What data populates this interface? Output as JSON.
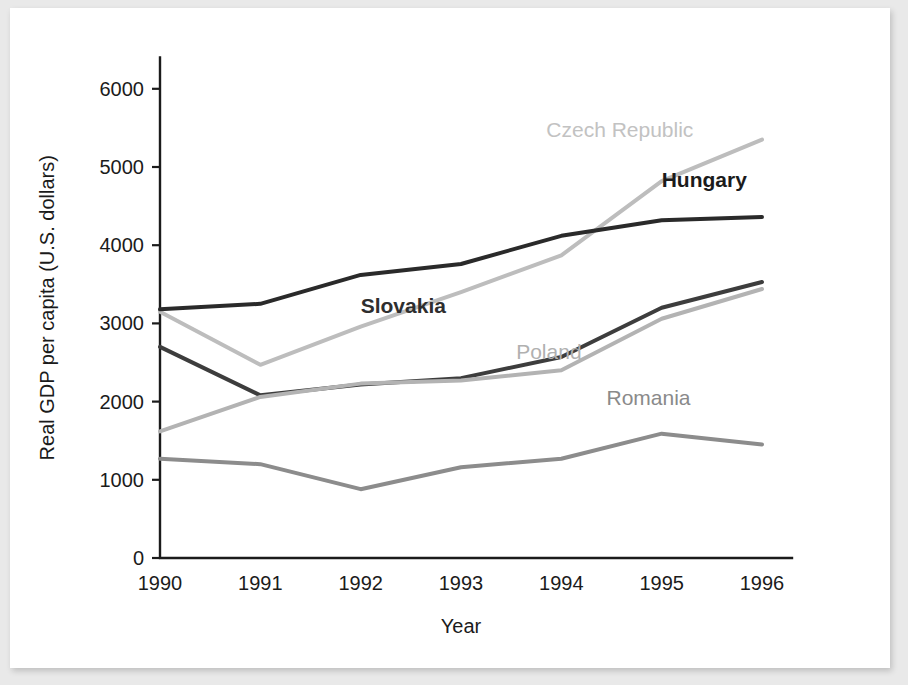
{
  "chart_data": {
    "type": "line",
    "title": "",
    "xlabel": "Year",
    "ylabel": "Real GDP per capita (U.S. dollars)",
    "x": [
      1990,
      1991,
      1992,
      1993,
      1994,
      1995,
      1996
    ],
    "xtick_labels": [
      "1990",
      "1991",
      "1992",
      "1993",
      "1994",
      "1995",
      "1996"
    ],
    "ytick_labels": [
      "0",
      "1000",
      "2000",
      "3000",
      "4000",
      "5000",
      "6000"
    ],
    "yticks": [
      0,
      1000,
      2000,
      3000,
      4000,
      5000,
      6000
    ],
    "ylim": [
      0,
      6400
    ],
    "xlim": [
      1990,
      1996
    ],
    "grid": false,
    "legend": "inline-labels",
    "series": [
      {
        "name": "Czech Republic",
        "color": "#bdbdbd",
        "label_color": "#c2c2c2",
        "label_bold": false,
        "width": 4,
        "values": [
          3150,
          2470,
          2960,
          3400,
          3870,
          4820,
          5350
        ],
        "label_x": 1993.85,
        "label_y": 5380,
        "label_anchor": "start"
      },
      {
        "name": "Hungary",
        "color": "#2a2a2a",
        "label_color": "#1b1b1b",
        "label_bold": true,
        "width": 4,
        "values": [
          3180,
          3250,
          3620,
          3760,
          4120,
          4320,
          4360
        ],
        "label_x": 1995.0,
        "label_y": 4740,
        "label_anchor": "start"
      },
      {
        "name": "Slovakia",
        "color": "#3d3d3d",
        "label_color": "#2e2e2e",
        "label_bold": true,
        "width": 4,
        "values": [
          2700,
          2080,
          2220,
          2300,
          2570,
          3200,
          3530
        ],
        "label_x": 1992.85,
        "label_y": 3130,
        "label_anchor": "end"
      },
      {
        "name": "Poland",
        "color": "#b3b3b3",
        "label_color": "#b0b0b0",
        "label_bold": false,
        "width": 4,
        "values": [
          1620,
          2060,
          2230,
          2270,
          2400,
          3060,
          3440
        ],
        "label_x": 1993.55,
        "label_y": 2540,
        "label_anchor": "start"
      },
      {
        "name": "Romania",
        "color": "#8c8c8c",
        "label_color": "#8a8a8a",
        "label_bold": false,
        "width": 4,
        "values": [
          1270,
          1200,
          880,
          1160,
          1270,
          1590,
          1450
        ],
        "label_x": 1994.45,
        "label_y": 1960,
        "label_anchor": "start"
      }
    ]
  }
}
